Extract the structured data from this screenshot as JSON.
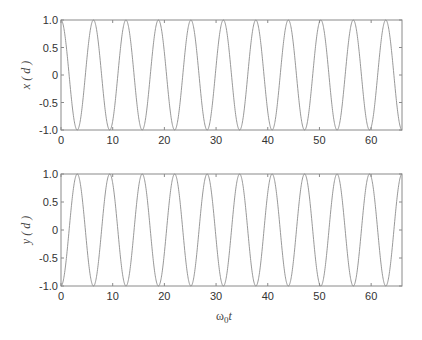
{
  "chart_data": [
    {
      "type": "line",
      "title": "",
      "xlabel": "",
      "ylabel": "x ( d )",
      "xlim": [
        0,
        65.97
      ],
      "ylim": [
        -1.0,
        1.0
      ],
      "xticks": [
        0,
        10,
        20,
        30,
        40,
        50,
        60
      ],
      "xtick_labels": [
        "0",
        "10",
        "20",
        "30",
        "40",
        "50",
        "60"
      ],
      "yticks": [
        1.0,
        0.5,
        0,
        -0.5,
        -1.0
      ],
      "ytick_labels": [
        "1.0",
        "0.5",
        "0",
        "-0.5",
        "-1.0"
      ],
      "grid": false,
      "legend": null,
      "series": [
        {
          "name": "x(d)",
          "function": "cos(t)",
          "amplitude": 1.0,
          "period": 6.2832,
          "phase_start_value": 1.0,
          "color": "#8c8c8c"
        }
      ]
    },
    {
      "type": "line",
      "title": "",
      "xlabel": "ω0t",
      "ylabel": "y ( d )",
      "xlim": [
        0,
        65.97
      ],
      "ylim": [
        -1.0,
        1.0
      ],
      "xticks": [
        0,
        10,
        20,
        30,
        40,
        50,
        60
      ],
      "xtick_labels": [
        "0",
        "10",
        "20",
        "30",
        "40",
        "50",
        "60"
      ],
      "yticks": [
        1.0,
        0.5,
        0,
        -0.5,
        -1.0
      ],
      "ytick_labels": [
        "1.0",
        "0.5",
        "0",
        "-0.5",
        "-1.0"
      ],
      "grid": false,
      "legend": null,
      "series": [
        {
          "name": "y(d)",
          "function": "-cos(t)",
          "amplitude": 1.0,
          "period": 6.2832,
          "phase_start_value": -1.0,
          "color": "#8c8c8c"
        }
      ]
    }
  ],
  "plots": {
    "top": {
      "ylabel": "x ( d )"
    },
    "bottom": {
      "ylabel": "y ( d )",
      "xlabel_main": "ω",
      "xlabel_sub": "0",
      "xlabel_tail": "t"
    }
  }
}
